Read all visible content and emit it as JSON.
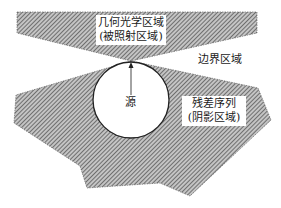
{
  "diagram": {
    "colors": {
      "hatch_line": "#5a5a5a",
      "hatch_bg": "#bdbdbd",
      "outline": "#333333",
      "circle_stroke": "#222222",
      "background": "#ffffff"
    },
    "regions": {
      "illuminated": {
        "title": "几何光学区域",
        "subtitle": "(被照射区域)"
      },
      "boundary": {
        "title": "边界区域"
      },
      "shadow": {
        "title": "残差序列",
        "subtitle": "(阴影区域)"
      }
    },
    "source": {
      "label": "源"
    }
  }
}
